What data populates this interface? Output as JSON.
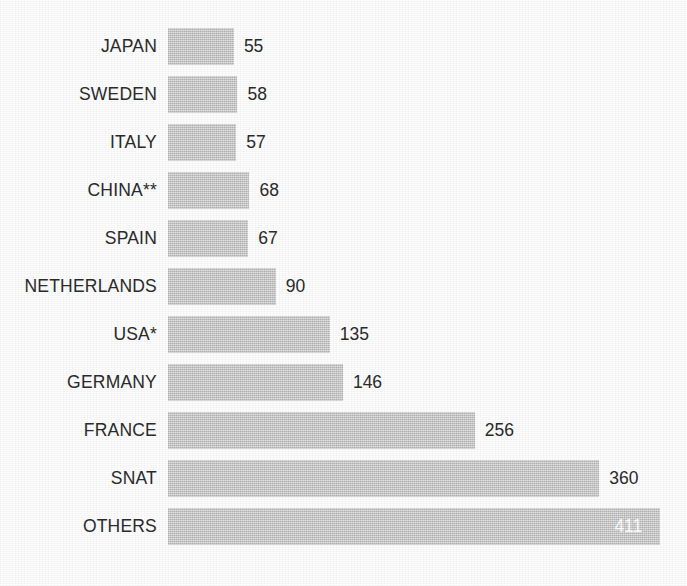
{
  "chart_data": {
    "type": "bar",
    "orientation": "horizontal",
    "title": "",
    "subtitle": "",
    "xlabel": "",
    "ylabel": "",
    "grid": false,
    "legend": false,
    "legend_position": "none",
    "axis_visible": false,
    "tick_labels": [],
    "xlim": [
      0,
      411
    ],
    "bar_color": "#c7c7c7",
    "label_color": "#2b2b2b",
    "inside_label_color": "#ffffff",
    "background_color": "#ffffff",
    "categories": [
      "JAPAN",
      "SWEDEN",
      "ITALY",
      "CHINA**",
      "SPAIN",
      "NETHERLANDS",
      "USA*",
      "GERMANY",
      "FRANCE",
      "SNAT",
      "OTHERS"
    ],
    "values": [
      55,
      58,
      57,
      68,
      67,
      90,
      135,
      146,
      256,
      360,
      411
    ],
    "bars": [
      {
        "label": "JAPAN",
        "value": 55,
        "value_text": "55",
        "label_placement": "outside"
      },
      {
        "label": "SWEDEN",
        "value": 58,
        "value_text": "58",
        "label_placement": "outside"
      },
      {
        "label": "ITALY",
        "value": 57,
        "value_text": "57",
        "label_placement": "outside"
      },
      {
        "label": "CHINA**",
        "value": 68,
        "value_text": "68",
        "label_placement": "outside"
      },
      {
        "label": "SPAIN",
        "value": 67,
        "value_text": "67",
        "label_placement": "outside"
      },
      {
        "label": "NETHERLANDS",
        "value": 90,
        "value_text": "90",
        "label_placement": "outside"
      },
      {
        "label": "USA*",
        "value": 135,
        "value_text": "135",
        "label_placement": "outside"
      },
      {
        "label": "GERMANY",
        "value": 146,
        "value_text": "146",
        "label_placement": "outside"
      },
      {
        "label": "FRANCE",
        "value": 256,
        "value_text": "256",
        "label_placement": "outside"
      },
      {
        "label": "SNAT",
        "value": 360,
        "value_text": "360",
        "label_placement": "outside"
      },
      {
        "label": "OTHERS",
        "value": 411,
        "value_text": "411",
        "label_placement": "inside"
      }
    ],
    "annotations": [
      {
        "text": "**",
        "attached_to": "CHINA**"
      },
      {
        "text": "*",
        "attached_to": "USA*"
      }
    ]
  },
  "layout": {
    "px_per_unit": 1.198,
    "bar_origin_x": 168,
    "bar_height": 37,
    "row_pitch": 48,
    "top_margin": 28,
    "value_gap": 10
  }
}
